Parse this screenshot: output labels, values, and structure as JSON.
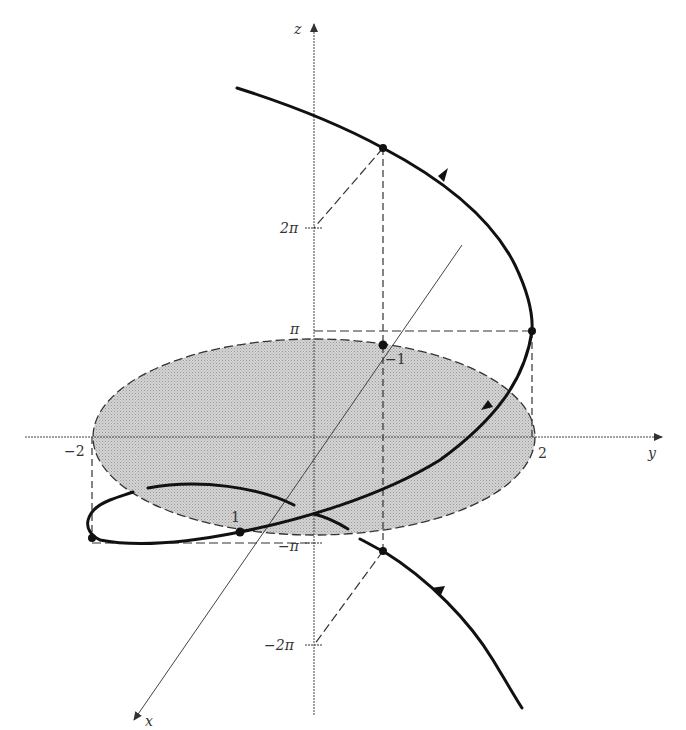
{
  "figure": {
    "axes": {
      "x_label": "x",
      "y_label": "y",
      "z_label": "z"
    },
    "tick_labels": {
      "z_pi": "π",
      "z_2pi": "2π",
      "z_neg_pi": "−π",
      "z_neg_2pi": "−2π",
      "y_neg2": "−2",
      "y_2": "2",
      "x_neg1": "−1",
      "x_1": "1"
    },
    "colors": {
      "curve": "#111111",
      "disk_fill": "#c8c8c8",
      "axis": "#444444",
      "guide": "#333333"
    }
  }
}
